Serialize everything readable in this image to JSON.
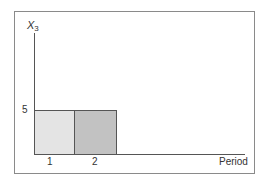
{
  "chart_data": {
    "type": "bar",
    "title": "",
    "xlabel": "Period",
    "ylabel": "X3",
    "ylabel_main": "X",
    "ylabel_sub": "3",
    "categories": [
      "1",
      "2"
    ],
    "values": [
      5,
      5
    ],
    "colors": [
      "#e4e4e4",
      "#c2c2c2"
    ],
    "yticks": [
      "5"
    ],
    "ylim": [
      0,
      6
    ],
    "grid": false,
    "legend": null
  }
}
